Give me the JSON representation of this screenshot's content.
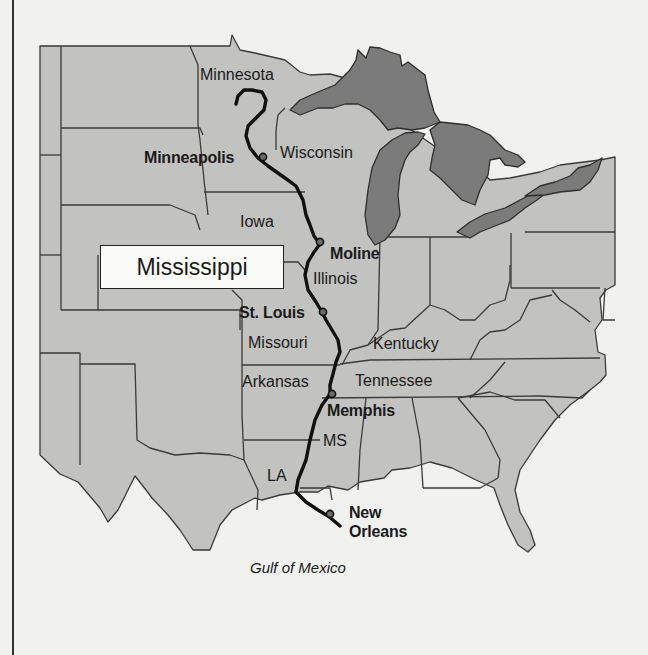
{
  "map": {
    "title": "Mississippi",
    "river_name": "Mississippi River",
    "colors": {
      "land": "#c2c2c0",
      "lakes": "#7b7b7b",
      "river": "#111111",
      "background": "#f1f1ef",
      "title_box": "#fbfbf9"
    },
    "state_labels": [
      {
        "name": "Minnesota"
      },
      {
        "name": "Wisconsin"
      },
      {
        "name": "Iowa"
      },
      {
        "name": "Illinois"
      },
      {
        "name": "Missouri"
      },
      {
        "name": "Kentucky"
      },
      {
        "name": "Arkansas"
      },
      {
        "name": "Tennessee"
      },
      {
        "name": "MS"
      },
      {
        "name": "LA"
      }
    ],
    "cities": [
      {
        "name": "Minneapolis"
      },
      {
        "name": "Moline"
      },
      {
        "name": "St. Louis"
      },
      {
        "name": "Memphis"
      },
      {
        "name": "New Orleans",
        "line1": "New",
        "line2": "Orleans"
      }
    ],
    "water_labels": [
      {
        "name": "Gulf of Mexico"
      }
    ]
  }
}
